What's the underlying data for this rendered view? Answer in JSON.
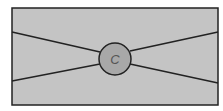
{
  "diagram": {
    "background": "#ffffff",
    "frame": {
      "x": 12,
      "y": 8,
      "width": 206,
      "height": 97,
      "fill": "#c4c4c4",
      "stroke": "#222222"
    },
    "center_node": {
      "cx": 115,
      "cy": 59,
      "r": 16,
      "fill": "#a8a8a8",
      "stroke": "#222222",
      "label": "C"
    },
    "lines": [
      {
        "x1": 12,
        "y1": 32,
        "x2": 100,
        "y2": 52
      },
      {
        "x1": 12,
        "y1": 81,
        "x2": 100,
        "y2": 64
      },
      {
        "x1": 130,
        "y1": 51,
        "x2": 218,
        "y2": 32
      },
      {
        "x1": 130,
        "y1": 64,
        "x2": 218,
        "y2": 83
      }
    ]
  }
}
